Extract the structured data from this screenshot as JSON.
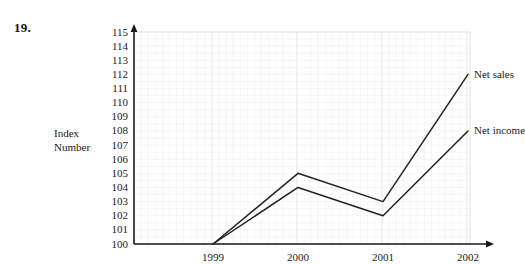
{
  "question_number": "19.",
  "axis_label": {
    "line1": "Index",
    "line2": "Number"
  },
  "chart_data": {
    "type": "line",
    "title": "",
    "xlabel": "",
    "ylabel": "Index Number",
    "categories": [
      "1999",
      "2000",
      "2001",
      "2002"
    ],
    "series": [
      {
        "name": "Net sales",
        "values": [
          100,
          105,
          103,
          112
        ]
      },
      {
        "name": "Net income",
        "values": [
          100,
          104,
          102,
          108
        ]
      }
    ],
    "yticks": [
      100,
      101,
      102,
      103,
      104,
      105,
      106,
      107,
      108,
      109,
      110,
      111,
      112,
      113,
      114,
      115
    ],
    "ylim": [
      100,
      115
    ],
    "xticks": [
      "1999",
      "2000",
      "2001",
      "2002"
    ],
    "grid": true,
    "grid_color": "#e2e2e6",
    "legend": "inline-right-of-line-ends",
    "line_color": "#222222",
    "axis_color": "#1a1a1a",
    "background": "#ffffff"
  }
}
